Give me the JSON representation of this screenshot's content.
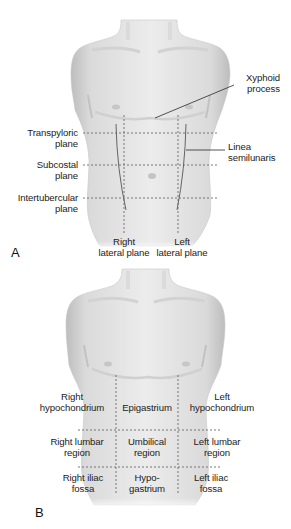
{
  "figure": {
    "panels": [
      {
        "letter": "A",
        "planes_horizontal": [
          {
            "line1": "Transpyloric",
            "line2": "plane"
          },
          {
            "line1": "Subcostal",
            "line2": "plane"
          },
          {
            "line1": "Intertubercular",
            "line2": "plane"
          }
        ],
        "planes_vertical": [
          {
            "line1": "Right",
            "line2": "lateral plane"
          },
          {
            "line1": "Left",
            "line2": "lateral plane"
          }
        ],
        "callouts": [
          {
            "line1": "Xyphoid",
            "line2": "process"
          },
          {
            "line1": "Linea",
            "line2": "semilunaris"
          }
        ]
      },
      {
        "letter": "B",
        "regions": [
          {
            "line1": "Right",
            "line2": "hypochondrium"
          },
          {
            "line1": "Epigastrium",
            "line2": ""
          },
          {
            "line1": "Left",
            "line2": "hypochondrium"
          },
          {
            "line1": "Right lumbar",
            "line2": "region"
          },
          {
            "line1": "Umbilical",
            "line2": "region"
          },
          {
            "line1": "Left lumbar",
            "line2": "region"
          },
          {
            "line1": "Right iliac",
            "line2": "fossa"
          },
          {
            "line1": "Hypo-",
            "line2": "gastrium"
          },
          {
            "line1": "Left iliac",
            "line2": "fossa"
          }
        ]
      }
    ],
    "colors": {
      "skin_light": "#ececec",
      "skin_mid": "#d2d2d2",
      "skin_dark": "#b4b4b4",
      "dashed_line": "#6a6a6a",
      "leader_line": "#2a2a2a",
      "text": "#222222"
    }
  }
}
